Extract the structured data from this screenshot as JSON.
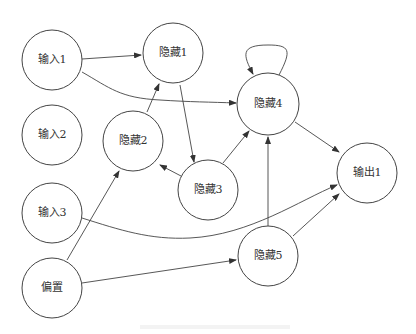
{
  "diagram": {
    "type": "neural-network-graph",
    "nodes": [
      {
        "id": "in1",
        "label": "输入1",
        "x": 52,
        "y": 60
      },
      {
        "id": "in2",
        "label": "输入2",
        "x": 52,
        "y": 135
      },
      {
        "id": "in3",
        "label": "输入3",
        "x": 52,
        "y": 213
      },
      {
        "id": "bias",
        "label": "偏置",
        "x": 52,
        "y": 288
      },
      {
        "id": "h1",
        "label": "隐藏1",
        "x": 173,
        "y": 53
      },
      {
        "id": "h2",
        "label": "隐藏2",
        "x": 133,
        "y": 141
      },
      {
        "id": "h3",
        "label": "隐藏3",
        "x": 208,
        "y": 190
      },
      {
        "id": "h4",
        "label": "隐藏4",
        "x": 268,
        "y": 104
      },
      {
        "id": "h5",
        "label": "隐藏5",
        "x": 268,
        "y": 256
      },
      {
        "id": "out1",
        "label": "输出1",
        "x": 367,
        "y": 173
      }
    ],
    "edges": [
      {
        "from": "in1",
        "to": "h1"
      },
      {
        "from": "in1",
        "to": "h4"
      },
      {
        "from": "h1",
        "to": "h3"
      },
      {
        "from": "h2",
        "to": "h1"
      },
      {
        "from": "h3",
        "to": "h2"
      },
      {
        "from": "h3",
        "to": "h4"
      },
      {
        "from": "h4",
        "to": "h4"
      },
      {
        "from": "h4",
        "to": "out1"
      },
      {
        "from": "in3",
        "to": "out1"
      },
      {
        "from": "bias",
        "to": "h2"
      },
      {
        "from": "bias",
        "to": "h5"
      },
      {
        "from": "h5",
        "to": "h4"
      },
      {
        "from": "h5",
        "to": "out1"
      }
    ]
  }
}
